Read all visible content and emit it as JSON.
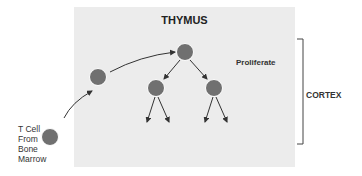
{
  "diagram": {
    "title": "THYMUS",
    "stage_label": "Proliferate",
    "region_label": "CORTEX",
    "source_label_lines": [
      "T Cell",
      "From",
      "Bone",
      "Marrow"
    ],
    "colors": {
      "box_fill": "#ececec",
      "cell_fill": "#707070",
      "cell_stroke": "#ffffff",
      "arrow": "#333333",
      "bracket": "#444444"
    },
    "nodes": [
      {
        "id": "source",
        "label": "T Cell From Bone Marrow",
        "cx": 50,
        "cy": 137
      },
      {
        "id": "entry",
        "cx": 98,
        "cy": 77
      },
      {
        "id": "parent",
        "cx": 185,
        "cy": 52
      },
      {
        "id": "child-left",
        "cx": 156,
        "cy": 88
      },
      {
        "id": "child-right",
        "cx": 214,
        "cy": 88
      }
    ],
    "edges": [
      {
        "from": "source",
        "to": "entry"
      },
      {
        "from": "entry",
        "to": "parent"
      },
      {
        "from": "parent",
        "to": "child-left"
      },
      {
        "from": "parent",
        "to": "child-right"
      },
      {
        "from": "child-left",
        "to": "offspring"
      },
      {
        "from": "child-left",
        "to": "offspring"
      },
      {
        "from": "child-right",
        "to": "offspring"
      },
      {
        "from": "child-right",
        "to": "offspring"
      }
    ]
  }
}
